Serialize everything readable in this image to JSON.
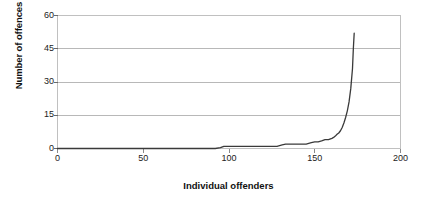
{
  "chart_data": {
    "type": "line",
    "title": "",
    "xlabel": "Individual offenders",
    "ylabel": "Number of offences",
    "xlim": [
      0,
      200
    ],
    "ylim": [
      0,
      60
    ],
    "xticks": [
      0,
      50,
      100,
      150,
      200
    ],
    "yticks": [
      0,
      15,
      30,
      45,
      60
    ],
    "grid": "horizontal",
    "legend": "none",
    "series": [
      {
        "name": "Offences per offender (sorted ascending)",
        "color": "#3a3a3a",
        "x": [
          0,
          20,
          40,
          60,
          80,
          92,
          95,
          97,
          100,
          110,
          120,
          128,
          131,
          133,
          140,
          145,
          148,
          150,
          152,
          154,
          156,
          158,
          160,
          161,
          162,
          163,
          164,
          165,
          166,
          167,
          168,
          169,
          170,
          171,
          172,
          172.5,
          173
        ],
        "y": [
          0,
          0,
          0,
          0,
          0,
          0,
          0.4,
          1,
          1,
          1,
          1,
          1,
          1.6,
          2,
          2,
          2,
          2.6,
          3,
          3,
          3.4,
          4,
          4,
          4.6,
          5,
          5.6,
          6.4,
          7,
          8,
          9.5,
          11.5,
          14,
          17,
          21,
          27,
          36,
          45,
          52
        ]
      }
    ]
  },
  "axis_labels": {
    "y": [
      "60",
      "45",
      "30",
      "15",
      "0"
    ],
    "x": [
      "0",
      "50",
      "100",
      "150",
      "200"
    ]
  },
  "colors": {
    "line": "#3a3a3a",
    "grid": "#b8b8b8",
    "frame": "#c0c0c0",
    "background": "#ffffff",
    "text": "#111111"
  }
}
